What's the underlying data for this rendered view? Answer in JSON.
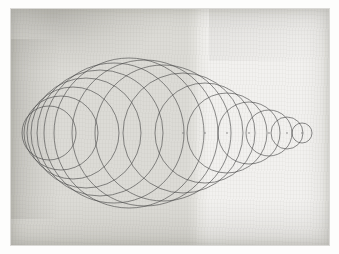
{
  "artwork": {
    "title": "Family of circles with common axis",
    "medium": "graphite pencil on textured paper",
    "description": "A sequence of circles whose centers all lie on a single horizontal axis; radii increase from a point at the left, reach a maximum left of center, then decrease to a point at the right, producing a lens or spindle shaped envelope.",
    "paper": {
      "left_panel_tone": "#dcdbd6",
      "right_panel_tone": "#f2f1ef",
      "panel_boundary_x": 196,
      "margin_color": "#ffffff"
    },
    "ink": {
      "line_color": "#4a4a4a",
      "line_width": 0.8,
      "center_dot_color": "#6e6e6e"
    },
    "axis": {
      "y": 124,
      "left_point_x": 10,
      "right_point_x": 309
    }
  },
  "chart_data": {
    "type": "scatter",
    "xlabel": "",
    "ylabel": "",
    "xlim": [
      0,
      318
    ],
    "ylim": [
      0,
      236
    ],
    "grid": false,
    "legend": null,
    "series": [
      {
        "name": "circles",
        "note": "cx = center x on axis, r = radius, both in paper pixel units",
        "points": [
          {
            "cx": 38,
            "cy": 124,
            "r": 27
          },
          {
            "cx": 50,
            "cy": 124,
            "r": 37
          },
          {
            "cx": 62,
            "cy": 124,
            "r": 46
          },
          {
            "cx": 75,
            "cy": 124,
            "r": 55
          },
          {
            "cx": 89,
            "cy": 124,
            "r": 63
          },
          {
            "cx": 103,
            "cy": 124,
            "r": 70
          },
          {
            "cx": 118,
            "cy": 124,
            "r": 75
          },
          {
            "cx": 134,
            "cy": 124,
            "r": 73
          },
          {
            "cx": 152,
            "cy": 124,
            "r": 68
          },
          {
            "cx": 172,
            "cy": 124,
            "r": 60
          },
          {
            "cx": 194,
            "cy": 124,
            "r": 50
          },
          {
            "cx": 216,
            "cy": 124,
            "r": 40
          },
          {
            "cx": 238,
            "cy": 124,
            "r": 31
          },
          {
            "cx": 258,
            "cy": 124,
            "r": 23
          },
          {
            "cx": 276,
            "cy": 124,
            "r": 16
          },
          {
            "cx": 291,
            "cy": 124,
            "r": 10
          }
        ]
      },
      {
        "name": "center_dots",
        "note": "faintly marked circle centers visible along the axis",
        "x": [
          172,
          194,
          216,
          238,
          258,
          276,
          291
        ],
        "y": [
          124,
          124,
          124,
          124,
          124,
          124,
          124
        ]
      }
    ]
  }
}
